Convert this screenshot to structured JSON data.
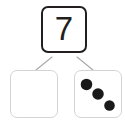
{
  "item_label": ")",
  "whole": {
    "value": "7",
    "border_color": "#231f20"
  },
  "parts": [
    {
      "name": "empty-part",
      "content": "",
      "dot_count": 0,
      "border_color": "#d4d4d4"
    },
    {
      "name": "dice-part",
      "content": "",
      "dot_count": 3,
      "border_color": "#d4d4d4",
      "dot_color": "#1a1a1a"
    }
  ],
  "connectors": {
    "color": "#a8a8a8",
    "count": 2
  },
  "dice_pips": [
    {
      "cx": 12,
      "cy": 14,
      "r": 6
    },
    {
      "cx": 24,
      "cy": 24,
      "r": 6
    },
    {
      "cx": 36,
      "cy": 36,
      "r": 5.5
    }
  ],
  "colors": {
    "background": "#ffffff",
    "ink": "#231f20",
    "light_border": "#d4d4d4",
    "connector": "#a8a8a8"
  }
}
